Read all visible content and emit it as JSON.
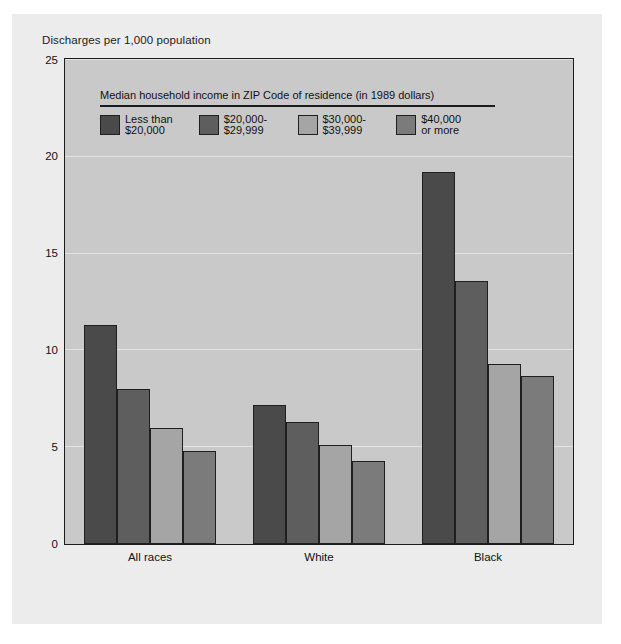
{
  "figure": {
    "background_color": "#ececed",
    "plot_background_color": "#c9c9c9"
  },
  "axis_title": "Discharges per 1,000 population",
  "legend": {
    "title": "Median household income in ZIP Code of residence (in 1989 dollars)",
    "items": [
      {
        "label": "Less than\n$20,000",
        "color": "#4a4a4a"
      },
      {
        "label": "$20,000-\n$29,999",
        "color": "#5e5e5e"
      },
      {
        "label": "$30,000-\n$39,999",
        "color": "#a5a5a5"
      },
      {
        "label": "$40,000\nor more",
        "color": "#7b7b7b"
      }
    ]
  },
  "chart_data": {
    "type": "bar",
    "title": "",
    "xlabel": "",
    "ylabel": "Discharges per 1,000 population",
    "categories": [
      "All races",
      "White",
      "Black"
    ],
    "ylim": [
      0,
      25
    ],
    "yticks": [
      0,
      5,
      10,
      15,
      20,
      25
    ],
    "grid": true,
    "legend_position": "inside-top-left",
    "series": [
      {
        "name": "Less than $20,000",
        "color": "#4a4a4a",
        "values": [
          11.3,
          7.2,
          19.2
        ]
      },
      {
        "name": "$20,000-$29,999",
        "color": "#5e5e5e",
        "values": [
          8.0,
          6.3,
          13.6
        ]
      },
      {
        "name": "$30,000-$39,999",
        "color": "#a5a5a5",
        "values": [
          6.0,
          5.1,
          9.3
        ]
      },
      {
        "name": "$40,000 or more",
        "color": "#7b7b7b",
        "values": [
          4.8,
          4.3,
          8.7
        ]
      }
    ]
  }
}
